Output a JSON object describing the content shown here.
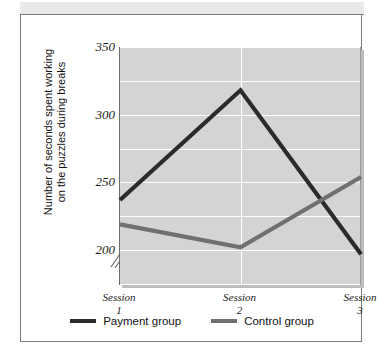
{
  "figure": {
    "background_color": "#ffffff",
    "frame_color": "#7e7e7e",
    "header_strip_color": "#e9e9e9"
  },
  "chart_data": {
    "type": "line",
    "title": "",
    "xlabel": "",
    "ylabel": "Number of seconds spent working\non the puzzles during breaks",
    "categories": [
      "Session 1",
      "Session 2",
      "Session 3"
    ],
    "x_tick_lines": [
      {
        "name": "Session",
        "number": "1"
      },
      {
        "name": "Session",
        "number": "2"
      },
      {
        "name": "Session",
        "number": "3"
      }
    ],
    "ylim": [
      175,
      350
    ],
    "y_tick_labels": [
      "350",
      "300",
      "250",
      "200"
    ],
    "y_tick_values": [
      350,
      300,
      250,
      200
    ],
    "gridlines": [
      350,
      325,
      300,
      275,
      250,
      225,
      200,
      175
    ],
    "grid": true,
    "grid_color": "#ffffff",
    "plot_background": "#d4d4d4",
    "axis_break": true,
    "axis_break_symbol": "//",
    "legend_position": "bottom-center",
    "series": [
      {
        "name": "Payment group",
        "color": "#2b2b2b",
        "values": [
          237,
          318,
          197
        ]
      },
      {
        "name": "Control group",
        "color": "#707070",
        "values": [
          219,
          202,
          254
        ]
      }
    ]
  },
  "legend": {
    "items": [
      {
        "label": "Payment group",
        "color": "#2b2b2b"
      },
      {
        "label": "Control group",
        "color": "#707070"
      }
    ]
  }
}
